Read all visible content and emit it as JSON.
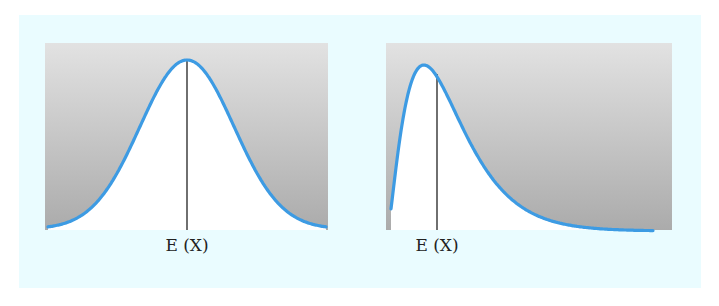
{
  "figure": {
    "background_color": "#eafcff",
    "panel_gradient_top": "#e2e2e2",
    "panel_gradient_bottom": "#ababab",
    "curve_color": "#3d9be3",
    "line_color": "#222222"
  },
  "panels": [
    {
      "name": "symmetric",
      "label": "E (X)",
      "description": "Symmetric bell-shaped density; expected value at the peak"
    },
    {
      "name": "right-skewed",
      "label": "E (X)",
      "description": "Right-skewed density; expected value to the right of the peak"
    }
  ],
  "chart_data": [
    {
      "type": "line",
      "title": "",
      "xlabel": "E (X)",
      "ylabel": "",
      "shape": "normal (symmetric)",
      "mean_marker": "vertical line at peak",
      "x": [
        -3,
        -2.5,
        -2,
        -1.5,
        -1,
        -0.5,
        0,
        0.5,
        1,
        1.5,
        2,
        2.5,
        3
      ],
      "values": [
        0.011,
        0.044,
        0.135,
        0.325,
        0.607,
        0.882,
        1.0,
        0.882,
        0.607,
        0.325,
        0.135,
        0.044,
        0.011
      ],
      "grid": false,
      "legend": "none"
    },
    {
      "type": "line",
      "title": "",
      "xlabel": "E (X)",
      "ylabel": "",
      "shape": "right-skewed",
      "mean_marker": "vertical line slightly right of mode",
      "x": [
        0,
        0.5,
        1,
        1.5,
        2,
        3,
        4,
        5,
        6,
        7,
        8,
        10
      ],
      "values": [
        0.04,
        0.65,
        0.97,
        0.99,
        0.88,
        0.6,
        0.36,
        0.2,
        0.11,
        0.06,
        0.03,
        0.01
      ],
      "grid": false,
      "legend": "none"
    }
  ]
}
